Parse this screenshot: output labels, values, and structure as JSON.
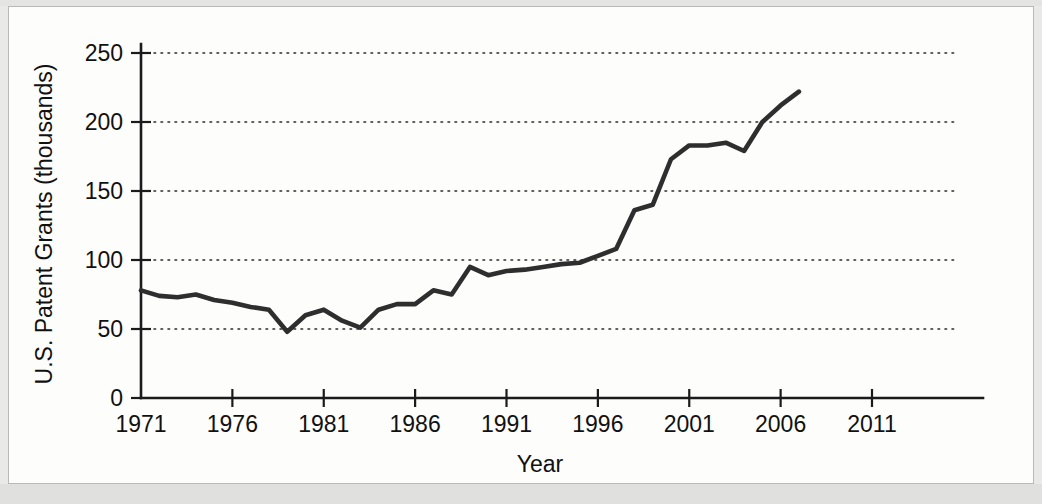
{
  "chart_data": {
    "type": "line",
    "title": "",
    "xlabel": "Year",
    "ylabel": "U.S. Patent Grants (thousands)",
    "xlim": [
      1971,
      2011
    ],
    "ylim": [
      0,
      250
    ],
    "xticks": [
      1971,
      1976,
      1981,
      1986,
      1991,
      1996,
      2001,
      2006,
      2011
    ],
    "yticks": [
      0,
      50,
      100,
      150,
      200,
      250
    ],
    "xtick_labels": [
      "1971",
      "1976",
      "1981",
      "1986",
      "1991",
      "1996",
      "2001",
      "2006",
      "2011"
    ],
    "ytick_labels": [
      "0",
      "50",
      "100",
      "150",
      "200",
      "250"
    ],
    "grid": "horizontal-dotted",
    "legend": "none",
    "series": [
      {
        "name": "U.S. Patent Grants",
        "line_color": "#2e2e2e",
        "x": [
          1971,
          1972,
          1973,
          1974,
          1975,
          1976,
          1977,
          1978,
          1979,
          1980,
          1981,
          1982,
          1983,
          1984,
          1985,
          1986,
          1987,
          1988,
          1989,
          1990,
          1991,
          1992,
          1993,
          1994,
          1995,
          1996,
          1997,
          1998,
          1999,
          2000,
          2001,
          2002,
          2003,
          2004,
          2005,
          2006,
          2007
        ],
        "values": [
          78,
          74,
          73,
          75,
          71,
          69,
          66,
          64,
          48,
          60,
          64,
          56,
          51,
          64,
          68,
          68,
          78,
          75,
          95,
          89,
          92,
          93,
          95,
          97,
          98,
          103,
          108,
          136,
          140,
          173,
          183,
          183,
          185,
          179,
          200,
          212,
          222
        ]
      }
    ]
  },
  "axes": {
    "y_title": "U.S. Patent Grants (thousands)",
    "x_title": "Year"
  }
}
